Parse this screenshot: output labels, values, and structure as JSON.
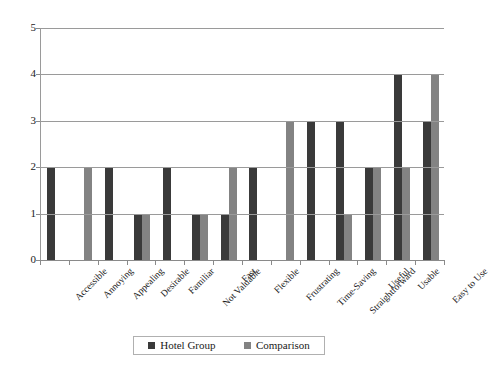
{
  "chart_data": {
    "type": "bar",
    "title": "",
    "subtitle": "",
    "xlabel": "",
    "ylabel": "",
    "ylim": [
      0,
      5
    ],
    "yticks": [
      "0",
      "1",
      "2",
      "3",
      "4",
      "5"
    ],
    "grid": true,
    "legend_position": "bottom-center",
    "categories": [
      "Accessible",
      "Annoying",
      "Appealing",
      "Desirable",
      "Familiar",
      "Not Valuable",
      "Fast",
      "Flexible",
      "Frustrating",
      "Time-Saving",
      "Straightforward",
      "Useful",
      "Usable",
      "Easy to Use"
    ],
    "series": [
      {
        "name": "Hotel Group",
        "color": "#3a3a3a",
        "values": [
          2,
          0,
          2,
          1,
          2,
          1,
          1,
          2,
          0,
          3,
          3,
          2,
          4,
          3
        ]
      },
      {
        "name": "Comparison",
        "color": "#838383",
        "values": [
          0,
          2,
          0,
          1,
          0,
          1,
          2,
          0,
          3,
          0,
          1,
          2,
          2,
          4
        ]
      }
    ]
  },
  "legend": {
    "items": [
      {
        "label": "Hotel Group",
        "swatch": "dark"
      },
      {
        "label": "Comparison",
        "swatch": "light"
      }
    ]
  }
}
